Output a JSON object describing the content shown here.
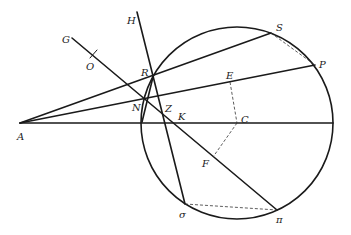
{
  "diagram": {
    "type": "geometric-construction",
    "circle": {
      "center": "C",
      "cx": 237,
      "cy": 123,
      "r": 96
    },
    "points": {
      "A": [
        20,
        123
      ],
      "G": [
        72,
        38
      ],
      "O": [
        93,
        55
      ],
      "H": [
        137,
        12
      ],
      "R": [
        153,
        77
      ],
      "N": [
        145,
        98
      ],
      "Z": [
        163,
        115
      ],
      "K": [
        167,
        123
      ],
      "S": [
        271,
        33
      ],
      "P": [
        315,
        65
      ],
      "E": [
        230,
        82
      ],
      "C": [
        237,
        123
      ],
      "F": [
        213,
        157
      ],
      "sigma": [
        185,
        204
      ],
      "pi": [
        277,
        210
      ]
    },
    "labels": {
      "A": "A",
      "G": "G",
      "O": "O",
      "H": "H",
      "R": "R",
      "N": "N",
      "Z": "Z",
      "K": "K",
      "S": "S",
      "P": "P",
      "E": "E",
      "C": "C",
      "F": "F",
      "sigma": "σ",
      "pi": "π"
    },
    "solid_lines": [
      [
        "A",
        "S"
      ],
      [
        "A",
        "P"
      ],
      [
        "A",
        "diameter-end"
      ],
      [
        "G",
        "pi"
      ],
      [
        "H",
        "sigma"
      ]
    ],
    "dashed_lines": [
      [
        "S",
        "P"
      ],
      [
        "E",
        "C"
      ],
      [
        "C",
        "F"
      ],
      [
        "sigma",
        "pi"
      ]
    ]
  }
}
